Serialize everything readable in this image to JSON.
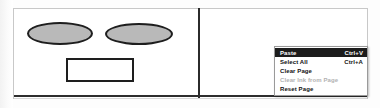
{
  "document": {
    "title": "Page Canvas with Context Menu",
    "background_color": "#fdfdfd",
    "frame_border_color": "#c8c8c8",
    "divider_color": "#2b2b2b",
    "rule_color": "#2e2e2e"
  },
  "left_panel": {
    "name": "drawing-canvas",
    "shapes": [
      {
        "id": "ellipse-one",
        "type": "ellipse",
        "fill": "#b9b9b9",
        "stroke": "#1e1e1e"
      },
      {
        "id": "ellipse-two",
        "type": "ellipse",
        "fill": "#b9b9b9",
        "stroke": "#1e1e1e"
      },
      {
        "id": "rectangle-one",
        "type": "rectangle",
        "fill": "#ffffff",
        "stroke": "#1e1e1e"
      }
    ]
  },
  "right_panel": {
    "name": "blank-page",
    "background": "#ffffff"
  },
  "context_menu": {
    "highlight_color": "#1c1c1c",
    "disabled_color": "#b2b2b2",
    "items": [
      {
        "label": "Paste",
        "shortcut": "Ctrl+V",
        "state": "highlighted",
        "enabled": true
      },
      {
        "label": "Select All",
        "shortcut": "Ctrl+A",
        "state": "normal",
        "enabled": true
      },
      {
        "label": "Clear Page",
        "shortcut": "",
        "state": "normal",
        "enabled": true
      },
      {
        "label": "Clear Ink from Page",
        "shortcut": "",
        "state": "disabled",
        "enabled": false
      },
      {
        "label": "Reset Page",
        "shortcut": "",
        "state": "normal",
        "enabled": true
      }
    ]
  }
}
